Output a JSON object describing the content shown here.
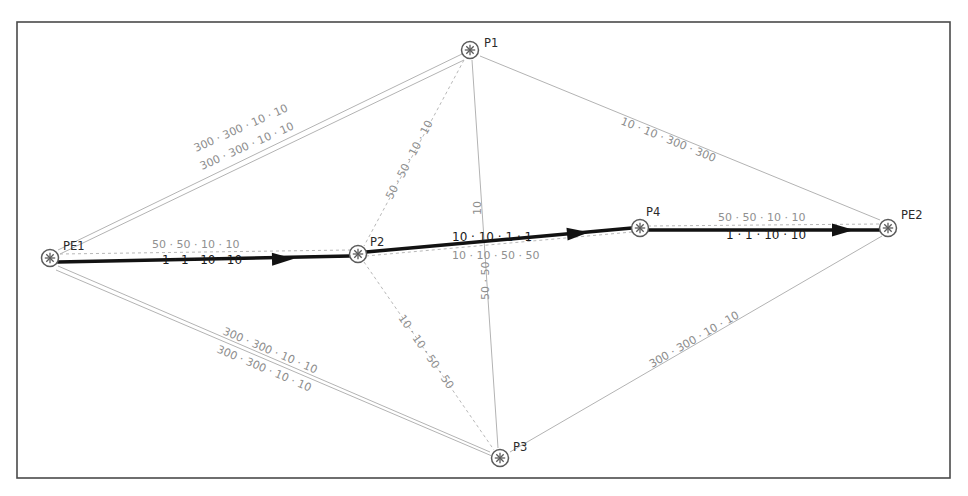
{
  "diagram": {
    "background_color": "#ffffff",
    "frame_color": "#4a4a4a",
    "thin_link_color": "#b3b3b3",
    "dashed_link_color": "#b8b8b8",
    "bold_path_color": "#121212",
    "node_label_color": "#2b2b2b",
    "metric_label_color": "#8d8d8d"
  },
  "nodes": [
    {
      "id": "PE1",
      "label": "PE1",
      "x": 50,
      "y": 258,
      "label_dx": 13,
      "label_dy": -8
    },
    {
      "id": "P1",
      "label": "P1",
      "x": 470,
      "y": 50,
      "label_dx": 14,
      "label_dy": -3
    },
    {
      "id": "P2",
      "label": "P2",
      "x": 358,
      "y": 254,
      "label_dx": 12,
      "label_dy": -8
    },
    {
      "id": "P3",
      "label": "P3",
      "x": 500,
      "y": 458,
      "label_dx": 13,
      "label_dy": -7
    },
    {
      "id": "P4",
      "label": "P4",
      "x": 640,
      "y": 228,
      "label_dx": 6,
      "label_dy": -12
    },
    {
      "id": "PE2",
      "label": "PE2",
      "x": 888,
      "y": 228,
      "label_dx": 13,
      "label_dy": -9
    }
  ],
  "links": [
    {
      "id": "pe1-p1-upper",
      "from": "PE1",
      "to": "P1",
      "style": "thin",
      "x1": 58,
      "y1": 250,
      "x2": 462,
      "y2": 54,
      "label": "300 · 300 · 10 · 10",
      "label_x": 196,
      "label_y": 152,
      "label_rotate": -24
    },
    {
      "id": "pe1-p1-lower",
      "from": "PE1",
      "to": "P1",
      "style": "thin",
      "x1": 60,
      "y1": 254,
      "x2": 464,
      "y2": 60,
      "label": "300 · 300 · 10 · 10",
      "label_x": 202,
      "label_y": 170,
      "label_rotate": -24
    },
    {
      "id": "p1-pe2",
      "from": "P1",
      "to": "PE2",
      "style": "thin",
      "x1": 480,
      "y1": 56,
      "x2": 880,
      "y2": 220,
      "label": "10 · 10 · 300 · 300",
      "label_x": 620,
      "label_y": 124,
      "label_rotate": 22
    },
    {
      "id": "p1-p2",
      "from": "P1",
      "to": "P2",
      "style": "dashed",
      "x1": 464,
      "y1": 60,
      "x2": 364,
      "y2": 246,
      "label": "50 · 50 · 10 · 10",
      "label_x": 392,
      "label_y": 200,
      "label_rotate": -62
    },
    {
      "id": "p1-p3",
      "from": "P1",
      "to": "P3",
      "style": "thin",
      "x1": 472,
      "y1": 60,
      "x2": 498,
      "y2": 448,
      "label_top": "10",
      "label_top_x": 481,
      "label_top_y": 215,
      "label_top_rotate": -90,
      "label_bottom": "50 · 50",
      "label_bottom_x": 489,
      "label_bottom_y": 300,
      "label_bottom_rotate": -90
    },
    {
      "id": "p2-p3",
      "from": "P2",
      "to": "P3",
      "style": "dashed",
      "x1": 364,
      "y1": 262,
      "x2": 494,
      "y2": 450,
      "label": "10 · 10 · 50 · 50",
      "label_x": 398,
      "label_y": 318,
      "label_rotate": 55
    },
    {
      "id": "pe1-p3-upper",
      "from": "PE1",
      "to": "P3",
      "style": "thin",
      "x1": 58,
      "y1": 266,
      "x2": 490,
      "y2": 452,
      "label": "300 · 300 · 10 · 10",
      "label_x": 222,
      "label_y": 334,
      "label_rotate": 23
    },
    {
      "id": "pe1-p3-lower",
      "from": "PE1",
      "to": "P3",
      "style": "thin",
      "x1": 56,
      "y1": 270,
      "x2": 492,
      "y2": 456,
      "label": "300 · 300 · 10 · 10",
      "label_x": 216,
      "label_y": 352,
      "label_rotate": 23
    },
    {
      "id": "p3-pe2",
      "from": "P3",
      "to": "PE2",
      "style": "thin",
      "x1": 510,
      "y1": 452,
      "x2": 882,
      "y2": 236,
      "label": "300 · 300 · 10 · 10",
      "label_x": 652,
      "label_y": 368,
      "label_rotate": -30
    },
    {
      "id": "pe1-p2-dashed",
      "from": "PE1",
      "to": "P2",
      "style": "dashed",
      "x1": 60,
      "y1": 254,
      "x2": 350,
      "y2": 250,
      "label": "50 · 50 · 10 · 10",
      "label_x": 152,
      "label_y": 248,
      "label_rotate": 0
    },
    {
      "id": "p2-p4-dashed",
      "from": "P2",
      "to": "P4",
      "style": "dashed",
      "x1": 366,
      "y1": 256,
      "x2": 632,
      "y2": 232,
      "label": "10 · 10 · 50 · 50",
      "label_x": 452,
      "label_y": 259,
      "label_rotate": 0
    },
    {
      "id": "p4-pe2-dashed",
      "from": "P4",
      "to": "PE2",
      "style": "dashed",
      "x1": 648,
      "y1": 226,
      "x2": 880,
      "y2": 224,
      "label": "50 · 50 · 10 · 10",
      "label_x": 718,
      "label_y": 221,
      "label_rotate": 0
    }
  ],
  "lsp_path": {
    "description": "Bold label-switched path PE1 to PE2 via P2 and P4",
    "segments": [
      {
        "id": "lsp-pe1-p2",
        "from": "PE1",
        "to": "P2",
        "x1": 58,
        "y1": 262,
        "x2": 350,
        "y2": 256,
        "label": "1 · 1 · 10 · 10",
        "label_x": 162,
        "label_y": 264,
        "label_rotate": 0,
        "arrow_x": 285,
        "arrow_y": 259,
        "arrow_rotate": -1
      },
      {
        "id": "lsp-p2-p4",
        "from": "P2",
        "to": "P4",
        "x1": 366,
        "y1": 252,
        "x2": 632,
        "y2": 228,
        "label": "10 · 10 · 1 · 1",
        "label_x": 452,
        "label_y": 241,
        "label_rotate": 0,
        "arrow_x": 580,
        "arrow_y": 233,
        "arrow_rotate": -5
      },
      {
        "id": "lsp-p4-pe2",
        "from": "P4",
        "to": "PE2",
        "x1": 648,
        "y1": 230,
        "x2": 880,
        "y2": 230,
        "label": "1 · 1 · 10 · 10",
        "label_x": 726,
        "label_y": 239,
        "label_rotate": 0,
        "arrow_x": 845,
        "arrow_y": 230,
        "arrow_rotate": 0
      }
    ]
  },
  "frame": {
    "x": 17,
    "y": 22,
    "width": 933,
    "height": 456
  }
}
